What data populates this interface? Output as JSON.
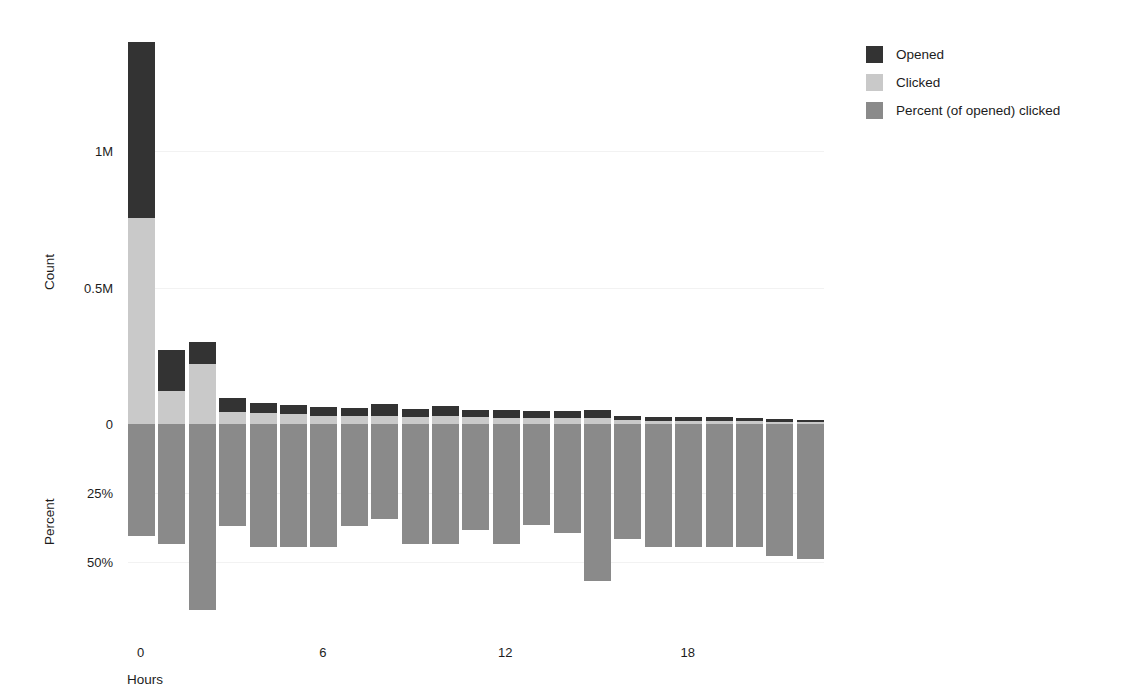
{
  "chart_data": {
    "type": "bar",
    "title": "",
    "subtitle": "",
    "xlabel": "Hours",
    "ylabel_top": "Count",
    "ylabel_bottom": "Percent",
    "orientation": "vertical",
    "stacked": true,
    "grid": true,
    "legend_position": "right",
    "x": [
      0,
      1,
      2,
      3,
      4,
      5,
      6,
      7,
      8,
      9,
      10,
      11,
      12,
      13,
      14,
      15,
      16,
      17,
      18,
      19,
      20,
      21,
      22
    ],
    "categories": [
      "0",
      "1",
      "2",
      "3",
      "4",
      "5",
      "6",
      "7",
      "8",
      "9",
      "10",
      "11",
      "12",
      "13",
      "14",
      "15",
      "16",
      "17",
      "18",
      "19",
      "20",
      "21",
      "22"
    ],
    "xticks": [
      0,
      6,
      12,
      18
    ],
    "xtick_labels": [
      "0",
      "6",
      "12",
      "18"
    ],
    "xlim": [
      -0.5,
      22.5
    ],
    "count_axis": {
      "label": "Count",
      "ticks": [
        0,
        500000,
        1000000
      ],
      "tick_labels": [
        "0",
        "0.5M",
        "1M"
      ],
      "ylim": [
        0,
        1400000
      ]
    },
    "percent_axis": {
      "label": "Percent",
      "ticks": [
        0,
        25,
        50
      ],
      "tick_labels": [
        "0",
        "25%",
        "50%"
      ],
      "ylim": [
        0,
        70
      ],
      "direction": "downward"
    },
    "series": [
      {
        "name": "Opened",
        "color": "#333333",
        "axis": "count",
        "values": [
          1400000,
          270000,
          300000,
          95000,
          78000,
          70000,
          62000,
          60000,
          72000,
          55000,
          66000,
          52000,
          50000,
          48000,
          46000,
          50000,
          30000,
          27000,
          26000,
          24000,
          22000,
          20000,
          16000
        ]
      },
      {
        "name": "Clicked",
        "color": "#c9c9c9",
        "axis": "count",
        "values": [
          755000,
          120000,
          220000,
          45000,
          40000,
          36000,
          30000,
          28000,
          30000,
          26000,
          28000,
          24000,
          23000,
          22000,
          21000,
          22000,
          14000,
          12000,
          12000,
          11000,
          10000,
          9000,
          7000
        ]
      },
      {
        "name": "Percent (of opened) clicked",
        "color": "#8a8a8a",
        "axis": "percent",
        "values": [
          40.5,
          43.5,
          67.5,
          37.0,
          44.5,
          44.5,
          44.5,
          37.0,
          34.5,
          43.5,
          43.5,
          38.5,
          43.5,
          36.5,
          39.5,
          57.0,
          41.5,
          44.5,
          44.5,
          44.5,
          44.5,
          48.0,
          49.0
        ]
      }
    ],
    "legend": [
      {
        "label": "Opened",
        "color": "#333333"
      },
      {
        "label": "Clicked",
        "color": "#c9c9c9"
      },
      {
        "label": "Percent (of opened) clicked",
        "color": "#8a8a8a"
      }
    ]
  },
  "colors": {
    "opened": "#333333",
    "clicked": "#c9c9c9",
    "percent": "#8a8a8a",
    "background": "#ffffff",
    "text": "#1c1c1c",
    "gridline": "#f2f2f2"
  }
}
